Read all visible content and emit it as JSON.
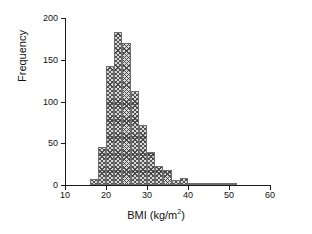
{
  "chart_data": {
    "type": "bar",
    "title": "",
    "xlabel": "BMI (kg/m2)",
    "xlabel_base": "BMI (kg/m",
    "xlabel_sup": "2",
    "xlabel_tail": ")",
    "ylabel": "Frequency",
    "xlim": [
      10,
      60
    ],
    "ylim": [
      0,
      200
    ],
    "xticks": [
      10,
      20,
      30,
      40,
      50,
      60
    ],
    "yticks": [
      0,
      50,
      100,
      150,
      200
    ],
    "grid": false,
    "legend": false,
    "bin_width": 2,
    "categories": [
      "16-18",
      "18-20",
      "20-22",
      "22-24",
      "24-26",
      "26-28",
      "28-30",
      "30-32",
      "32-34",
      "34-36",
      "36-38",
      "38-40",
      "40-42",
      "42-44",
      "44-46",
      "46-48",
      "48-50",
      "50-52"
    ],
    "bin_starts": [
      16,
      18,
      20,
      22,
      24,
      26,
      28,
      30,
      32,
      34,
      36,
      38,
      40,
      42,
      44,
      46,
      48,
      50
    ],
    "values": [
      7,
      45,
      142,
      183,
      170,
      113,
      72,
      39,
      23,
      18,
      6,
      9,
      1,
      1,
      1,
      1,
      1,
      1
    ],
    "bar_fill": "#d7d7d7",
    "bar_edge": "#6e6e6e",
    "axis_color": "#1a1a1a"
  }
}
